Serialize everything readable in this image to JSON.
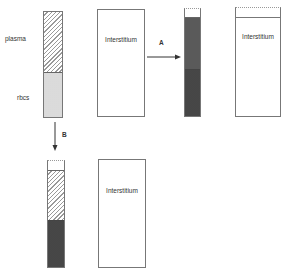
{
  "diagram": {
    "labels": {
      "plasma": "plasma",
      "rbcs": "rbcs",
      "interstitium": "Interstitium",
      "arrow_a": "A",
      "arrow_b": "B"
    },
    "panels": [
      {
        "id": "initial",
        "blood_column": [
          "plasma (hatched)",
          "rbcs (light dotted)"
        ],
        "interstitium": "Interstitium"
      },
      {
        "id": "after-A",
        "blood_column": [
          "empty top",
          "dense shaded",
          "dark dotted"
        ],
        "interstitium": "Interstitium (expanded top)"
      },
      {
        "id": "after-B",
        "blood_column": [
          "empty top",
          "plasma (hatched)",
          "rbcs (dark dotted)"
        ],
        "interstitium": "Interstitium"
      }
    ]
  }
}
